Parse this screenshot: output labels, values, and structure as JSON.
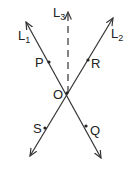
{
  "diagram": {
    "type": "intersecting-lines",
    "stroke_color": "#333333",
    "background": "#ffffff",
    "intersection": {
      "label": "O",
      "x": 67,
      "y": 93
    },
    "lines": [
      {
        "id": "L1",
        "label": "L",
        "subscript": "1",
        "style": "solid",
        "from": [
          101,
          158
        ],
        "to": [
          26,
          22
        ],
        "arrows": "both"
      },
      {
        "id": "L2",
        "label": "L",
        "subscript": "2",
        "style": "solid",
        "from": [
          30,
          156
        ],
        "to": [
          113,
          18
        ],
        "arrows": "both"
      },
      {
        "id": "L3",
        "label": "L",
        "subscript": "3",
        "style": "dashed",
        "from": [
          68,
          93
        ],
        "to": [
          68,
          12
        ],
        "arrows": "end"
      }
    ],
    "points": [
      {
        "label": "P",
        "on": "L1",
        "x": 49,
        "y": 62
      },
      {
        "label": "R",
        "on": "L2",
        "x": 88,
        "y": 60
      },
      {
        "label": "S",
        "on": "L2",
        "x": 45,
        "y": 128
      },
      {
        "label": "Q",
        "on": "L1",
        "x": 86,
        "y": 126
      }
    ]
  }
}
